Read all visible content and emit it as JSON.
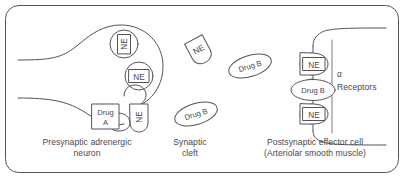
{
  "figure": {
    "border": {
      "shape": "rounded-rectangle",
      "color": "#55525a"
    },
    "ink_color": "#55525a",
    "text_color": "#4a4850",
    "background": "#ffffff"
  },
  "regions": {
    "presynaptic": {
      "caption_line1": "Presynaptic adrenergic",
      "caption_line2": "neuron"
    },
    "cleft": {
      "caption_line1": "Synaptic",
      "caption_line2": "cleft"
    },
    "postsynaptic": {
      "caption_line1": "Postsynaptic effector cell",
      "caption_line2": "(Arteriolar smooth muscle)"
    },
    "receptors": {
      "symbol": "α",
      "caption": "Receptors"
    }
  },
  "tokens": {
    "vesicle_ne_upper": "NE",
    "vesicle_ne_lower": "NE",
    "releasing_ne": "NE",
    "drug_a_line1": "Drug",
    "drug_a_line2": "A",
    "cleft_ne": "NE",
    "cleft_drug_b_upper": "Drug B",
    "cleft_drug_b_lower": "Drug B",
    "receptor_ne_top": "NE",
    "receptor_drug_b": "Drug B",
    "receptor_ne_bottom": "NE"
  }
}
